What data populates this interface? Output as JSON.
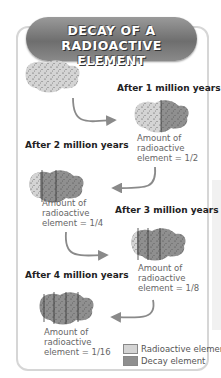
{
  "title": {
    "line1": "DECAY OF A",
    "line2": "RADIOACTIVE ELEMENT"
  },
  "stages": [
    {
      "label": "",
      "fraction": "1"
    },
    {
      "label": "After 1 million years",
      "amount_line1": "Amount of",
      "amount_line2": "radioactive",
      "amount_line3": "element = 1/2"
    },
    {
      "label": "After 2 million years",
      "amount_line1": "Amount of",
      "amount_line2": "radioactive",
      "amount_line3": "element = 1/4"
    },
    {
      "label": "After 3 million years",
      "amount_line1": "Amount of",
      "amount_line2": "radioactive",
      "amount_line3": "element = 1/8"
    },
    {
      "label": "After 4 million years",
      "amount_line1": "Amount of",
      "amount_line2": "radioactive",
      "amount_line3": "element = 1/16"
    }
  ],
  "legend": [
    {
      "label": "Radioactive element",
      "color": "#d4d4d4"
    },
    {
      "label": "Decay element",
      "color": "#8f8f8f"
    }
  ],
  "colors": {
    "radioactive": "#d4d4d4",
    "decay": "#8f8f8f",
    "arrow": "#8a8a8a",
    "banner": "#7a7a7a"
  }
}
